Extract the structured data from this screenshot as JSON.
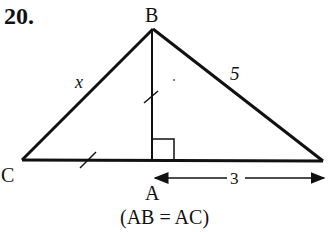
{
  "problem_number": "20.",
  "vertices": {
    "B": "B",
    "C": "C",
    "A": "A"
  },
  "side_labels": {
    "CB": "x",
    "B_right": "5",
    "A_right": "3"
  },
  "condition": "(AB = AC)",
  "colors": {
    "stroke": "#111111",
    "background": "#ffffff"
  }
}
